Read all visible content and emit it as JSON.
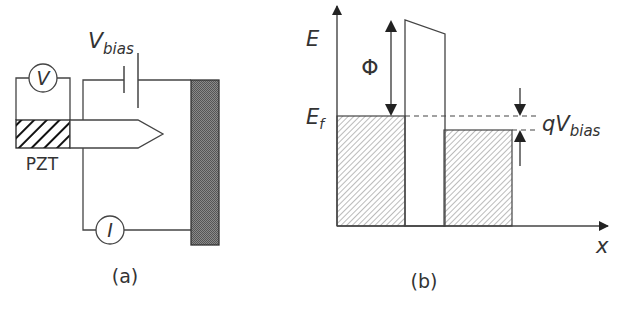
{
  "figure_a": {
    "caption": "(a)",
    "voltmeter_label": "V",
    "ammeter_label": "I",
    "pzt_label": "PZT",
    "bias_label_main": "V",
    "bias_label_sub": "bias"
  },
  "figure_b": {
    "caption": "(b)",
    "y_axis_label": "E",
    "x_axis_label": "x",
    "fermi_label_main": "E",
    "fermi_label_sub": "f",
    "work_function_label": "Φ",
    "bias_energy_label_q": "qV",
    "bias_energy_label_sub": "bias"
  },
  "colors": {
    "line": "#333333",
    "sample_fill": "#7a7a7a",
    "hatch": "#555555"
  }
}
